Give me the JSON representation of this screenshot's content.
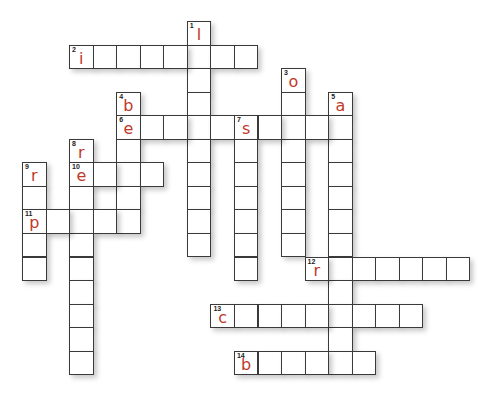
{
  "puzzle": {
    "type": "crossword",
    "cell_size": 23.55,
    "origin": {
      "x": 22,
      "y": 21
    },
    "colors": {
      "grid_line": "#3a3a3a",
      "cell_bg": "#ffffff",
      "letter": "#c0392b",
      "number": "#222222"
    },
    "words": [
      {
        "number": 1,
        "direction": "down",
        "col": 7,
        "row": 0,
        "length": 10,
        "first_letter": "l"
      },
      {
        "number": 2,
        "direction": "across",
        "col": 2,
        "row": 1,
        "length": 8,
        "first_letter": "i"
      },
      {
        "number": 3,
        "direction": "down",
        "col": 11,
        "row": 2,
        "length": 8,
        "first_letter": "o"
      },
      {
        "number": 4,
        "direction": "down",
        "col": 4,
        "row": 3,
        "length": 6,
        "first_letter": "b"
      },
      {
        "number": 5,
        "direction": "down",
        "col": 13,
        "row": 3,
        "length": 12,
        "first_letter": "a"
      },
      {
        "number": 6,
        "direction": "across",
        "col": 4,
        "row": 4,
        "length": 10,
        "first_letter": "e"
      },
      {
        "number": 7,
        "direction": "down",
        "col": 9,
        "row": 4,
        "length": 7,
        "first_letter": "s"
      },
      {
        "number": 8,
        "direction": "down",
        "col": 2,
        "row": 5,
        "length": 10,
        "first_letter": "r"
      },
      {
        "number": 9,
        "direction": "down",
        "col": 0,
        "row": 6,
        "length": 5,
        "first_letter": "r"
      },
      {
        "number": 10,
        "direction": "across",
        "col": 2,
        "row": 6,
        "length": 4,
        "first_letter": "e"
      },
      {
        "number": 11,
        "direction": "across",
        "col": 0,
        "row": 8,
        "length": 5,
        "first_letter": "p"
      },
      {
        "number": 12,
        "direction": "across",
        "col": 12,
        "row": 10,
        "length": 7,
        "first_letter": "r"
      },
      {
        "number": 13,
        "direction": "across",
        "col": 8,
        "row": 12,
        "length": 9,
        "first_letter": "c"
      },
      {
        "number": 14,
        "direction": "across",
        "col": 9,
        "row": 14,
        "length": 6,
        "first_letter": "b"
      }
    ]
  }
}
